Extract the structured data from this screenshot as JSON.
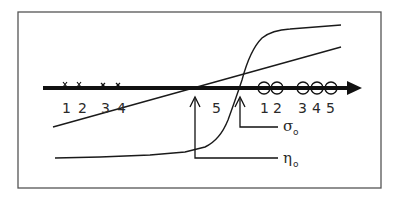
{
  "figure": {
    "colors": {
      "ink": "#1a1a1a",
      "frame": "#555555",
      "background": "#ffffff"
    }
  },
  "axis": {
    "direction": "right-arrow"
  },
  "left_group": {
    "marker": "x-mark",
    "labels": [
      "1",
      "2",
      "3",
      "4"
    ]
  },
  "middle_label": "5",
  "right_group": {
    "marker": "open-circle",
    "labels": [
      "1",
      "2",
      "3",
      "4",
      "5"
    ]
  },
  "curves": {
    "linear": "straight line",
    "sigmoid": "s-shaped curve"
  },
  "annotations": {
    "sigma": {
      "symbol": "σ",
      "subscript": "o"
    },
    "eta": {
      "symbol": "η",
      "subscript": "o"
    }
  }
}
